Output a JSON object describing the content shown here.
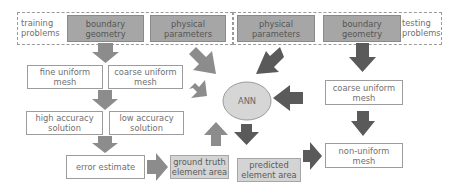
{
  "training": {
    "label": "training\nproblems",
    "boundary_geometry": "boundary\ngeometry",
    "physical_parameters": "physical\nparameters",
    "fine_uniform_mesh": "fine uniform\nmesh",
    "coarse_uniform_mesh": "coarse uniform\nmesh",
    "high_accuracy_solution": "high accuracy\nsolution",
    "low_accuracy_solution": "low accuracy\nsolution",
    "error_estimate": "error estimate",
    "ground_truth_element_area": "ground truth\nelement area"
  },
  "testing": {
    "label": "testing\nproblems",
    "physical_parameters": "physical\nparameters",
    "boundary_geometry": "boundary\ngeometry",
    "coarse_uniform_mesh": "coarse uniform\nmesh",
    "predicted_element_area": "predicted\nelement area",
    "non_uniform_mesh": "non-uniform\nmesh"
  },
  "ann": {
    "label": "ANN"
  },
  "colors": {
    "arrow_light": "#8c8c8c",
    "arrow_dark": "#5a5a5a",
    "box_dark": "#a6a6a6",
    "box_light": "#d4d4d4",
    "ann_fill": "#d6d6d6"
  }
}
